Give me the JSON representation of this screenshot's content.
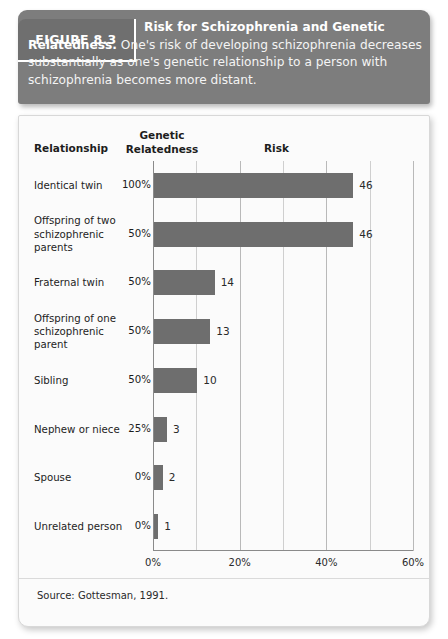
{
  "figure": {
    "badge_label": "FIGURE 8.3",
    "caption_bold": "Risk for Schizophrenia and Genetic Relatedness.",
    "caption_rest": " One's risk of developing schizophrenia decreases substantially as one's genetic relationship to a person with schizophrenia becomes more distant."
  },
  "columns": {
    "relationship": "Relationship",
    "genetic_relatedness_line1": "Genetic",
    "genetic_relatedness_line2": "Relatedness",
    "risk": "Risk"
  },
  "source": "Source: Gottesman, 1991.",
  "colors": {
    "bar": "#6e6e6e",
    "caption_band": "#7d7d7d",
    "badge": "#6f6f6f",
    "card_background": "#fbfbfb",
    "gridline": "#cfcfcf",
    "axis": "#8a8a8a"
  },
  "chart_data": {
    "type": "bar",
    "orientation": "horizontal",
    "title": "Risk for Schizophrenia and Genetic Relatedness",
    "xlabel": "Risk",
    "ylabel": "Relationship",
    "xlim": [
      0,
      60
    ],
    "xticks": [
      0,
      20,
      40,
      60
    ],
    "xticklabels": [
      "0%",
      "20%",
      "40%",
      "60%"
    ],
    "minor_gridline_interval": 10,
    "grid": true,
    "legend": false,
    "value_suffix": "",
    "categories": [
      "Identical twin",
      "Offspring of two schizophrenic parents",
      "Fraternal twin",
      "Offspring of one schizophrenic parent",
      "Sibling",
      "Nephew or niece",
      "Spouse",
      "Unrelated person"
    ],
    "values": [
      46,
      46,
      14,
      13,
      10,
      3,
      2,
      1
    ],
    "value_labels": [
      "46",
      "46",
      "14",
      "13",
      "10",
      "3",
      "2",
      "1"
    ],
    "genetic_relatedness": [
      "100%",
      "50%",
      "50%",
      "50%",
      "50%",
      "25%",
      "0%",
      "0%"
    ],
    "rows": [
      {
        "label": "Identical twin",
        "label_lines": [
          "Identical twin"
        ],
        "genetic": "100%",
        "value": 46,
        "value_label": "46"
      },
      {
        "label": "Offspring of two schizophrenic parents",
        "label_lines": [
          "Offspring of two",
          "schizophrenic",
          "parents"
        ],
        "genetic": "50%",
        "value": 46,
        "value_label": "46"
      },
      {
        "label": "Fraternal twin",
        "label_lines": [
          "Fraternal twin"
        ],
        "genetic": "50%",
        "value": 14,
        "value_label": "14"
      },
      {
        "label": "Offspring of one schizophrenic parent",
        "label_lines": [
          "Offspring of one",
          "schizophrenic",
          "parent"
        ],
        "genetic": "50%",
        "value": 13,
        "value_label": "13"
      },
      {
        "label": "Sibling",
        "label_lines": [
          "Sibling"
        ],
        "genetic": "50%",
        "value": 10,
        "value_label": "10"
      },
      {
        "label": "Nephew or niece",
        "label_lines": [
          "Nephew or niece"
        ],
        "genetic": "25%",
        "value": 3,
        "value_label": "3"
      },
      {
        "label": "Spouse",
        "label_lines": [
          "Spouse"
        ],
        "genetic": "0%",
        "value": 2,
        "value_label": "2"
      },
      {
        "label": "Unrelated person",
        "label_lines": [
          "Unrelated person"
        ],
        "genetic": "0%",
        "value": 1,
        "value_label": "1"
      }
    ]
  }
}
